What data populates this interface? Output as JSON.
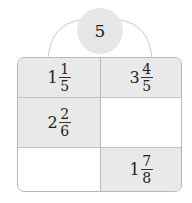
{
  "center": {
    "value": "5"
  },
  "cells": [
    {
      "row": 0,
      "col": 0,
      "shaded": true,
      "whole": "1",
      "num": "1",
      "den": "5"
    },
    {
      "row": 0,
      "col": 1,
      "shaded": true,
      "whole": "3",
      "num": "4",
      "den": "5"
    },
    {
      "row": 1,
      "col": 0,
      "shaded": true,
      "whole": "2",
      "num": "2",
      "den": "6"
    },
    {
      "row": 1,
      "col": 1,
      "shaded": false,
      "whole": "",
      "num": "",
      "den": ""
    },
    {
      "row": 2,
      "col": 0,
      "shaded": false,
      "whole": "",
      "num": "",
      "den": ""
    },
    {
      "row": 2,
      "col": 1,
      "shaded": true,
      "whole": "1",
      "num": "7",
      "den": "8"
    }
  ],
  "colors": {
    "shade": "#e9e9e9",
    "bubble": "#e6e6e6",
    "border": "#b8b8b8"
  }
}
